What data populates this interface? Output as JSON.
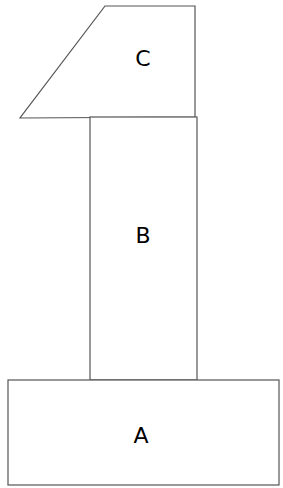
{
  "diagram": {
    "shapes": [
      {
        "id": "A",
        "label": "A",
        "type": "rectangle"
      },
      {
        "id": "B",
        "label": "B",
        "type": "rectangle"
      },
      {
        "id": "C",
        "label": "C",
        "type": "trapezoid"
      }
    ],
    "stroke_color": "#555555",
    "fill_color": "#ffffff"
  }
}
